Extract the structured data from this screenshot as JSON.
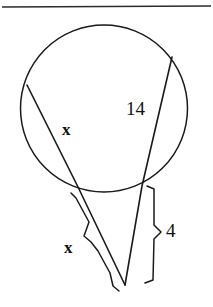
{
  "figure": {
    "background_color": "#ffffff",
    "stroke_color": "#1a1a1a",
    "width": 213,
    "height": 307
  },
  "top_rule": {
    "name": "page-divider-rule",
    "color": "#2b2b2b",
    "y": 7
  },
  "circle": {
    "name": "circle-outline",
    "cx": 104,
    "cy": 108,
    "r": 84,
    "stroke": "#1a1a1a"
  },
  "secants": [
    {
      "name": "left-secant",
      "far_point": {
        "x": 27,
        "y": 85
      },
      "near_point": {
        "x": 78,
        "y": 187
      },
      "apex": {
        "x": 125,
        "y": 285
      }
    },
    {
      "name": "right-secant",
      "far_point": {
        "x": 172,
        "y": 57
      },
      "near_point": {
        "x": 142,
        "y": 186
      },
      "apex": {
        "x": 125,
        "y": 285
      }
    }
  ],
  "labels": {
    "chord_left": "x",
    "chord_right": "14",
    "external_left": "x",
    "external_right": "4"
  },
  "label_positions": {
    "chord_left": {
      "x": 66,
      "y": 131
    },
    "chord_right": {
      "x": 137,
      "y": 111
    },
    "external_left": {
      "x": 68,
      "y": 249
    },
    "external_right": {
      "x": 172,
      "y": 233
    }
  },
  "braces": [
    {
      "name": "left-external-brace",
      "measures": "x",
      "direction": "left",
      "start": {
        "x": 72,
        "y": 194
      },
      "end": {
        "x": 124,
        "y": 292
      },
      "tip": {
        "x": 85,
        "y": 243
      }
    },
    {
      "name": "right-external-brace",
      "measures": "4",
      "direction": "right",
      "start": {
        "x": 151,
        "y": 187
      },
      "end": {
        "x": 145,
        "y": 284
      },
      "tip": {
        "x": 160,
        "y": 233
      }
    }
  ]
}
